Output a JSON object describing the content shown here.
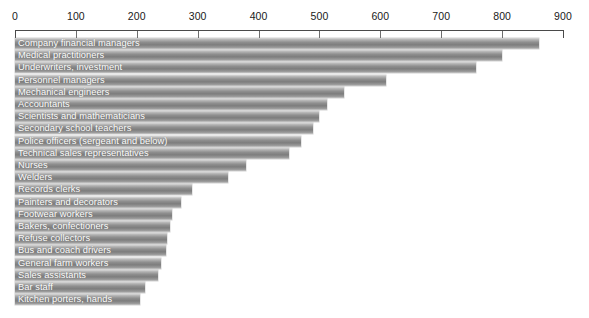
{
  "chart_data": {
    "type": "bar",
    "orientation": "horizontal",
    "title": "",
    "xlabel": "",
    "ylabel": "",
    "xlim": [
      0,
      900
    ],
    "xticks": [
      0,
      100,
      200,
      300,
      400,
      500,
      600,
      700,
      800,
      900
    ],
    "tick_labels": [
      "0",
      "100",
      "200",
      "300",
      "400",
      "500",
      "600",
      "700",
      "800",
      "900"
    ],
    "grid": false,
    "legend": "none",
    "bar_color": "#8f8f8f",
    "label_color": "#ffffff",
    "axis_color": "#4a4a4a",
    "categories": [
      "Company financial managers",
      "Medical practitioners",
      "Underwriters, investment",
      "Personnel managers",
      "Mechanical engineers",
      "Accountants",
      "Scientists and mathematicians",
      "Secondary school teachers",
      "Police officers (sergeant and below)",
      "Technical sales representatives",
      "Nurses",
      "Welders",
      "Records clerks",
      "Painters and decorators",
      "Footwear workers",
      "Bakers, confectioners",
      "Refuse collectors",
      "Bus and coach drivers",
      "General farm workers",
      "Sales assistants",
      "Bar staff",
      "Kitchen porters, hands"
    ],
    "values": [
      860,
      800,
      757,
      610,
      540,
      512,
      500,
      490,
      470,
      450,
      380,
      350,
      290,
      272,
      258,
      255,
      250,
      248,
      240,
      235,
      214,
      205
    ]
  }
}
